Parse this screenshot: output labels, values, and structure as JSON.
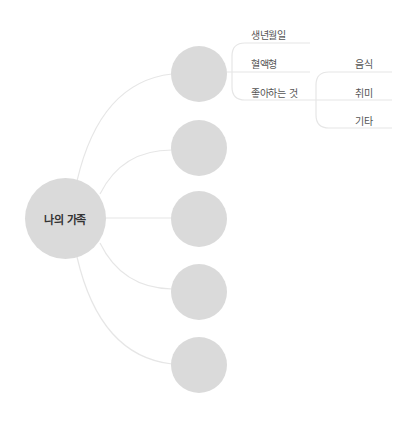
{
  "diagram": {
    "type": "mind-map",
    "colors": {
      "node_fill": "#dadada",
      "line": "#e6e6e6",
      "root_text": "#333333",
      "leaf_text": "#555555",
      "background": "#ffffff"
    },
    "root": {
      "label": "나의 가족"
    },
    "members": [
      {
        "label": "",
        "attributes": [
          {
            "label": "생년월일"
          },
          {
            "label": "혈액형"
          },
          {
            "label": "좋아하는 것",
            "children": [
              {
                "label": "음식"
              },
              {
                "label": "취미"
              },
              {
                "label": "기타"
              }
            ]
          }
        ]
      },
      {
        "label": ""
      },
      {
        "label": ""
      },
      {
        "label": ""
      },
      {
        "label": ""
      }
    ]
  }
}
